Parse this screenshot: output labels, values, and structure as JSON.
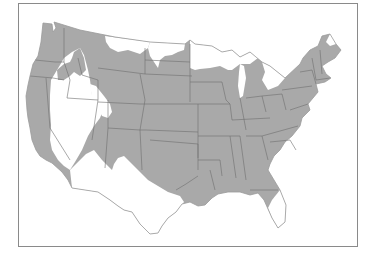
{
  "map": {
    "subject": "United States (contiguous) distribution map",
    "legend": [],
    "colors": {
      "shaded_region": "#a9a9a9",
      "unshaded_region": "#ffffff",
      "state_borders": "#6e6e6e",
      "frame": "#8a8a8a"
    },
    "regions": {
      "shaded": "Most of the contiguous US: Pacific coast (WA, OR, CA), northern Rockies, Great Plains, Midwest, South, and East Coast",
      "unshaded": [
        "Northern Minnesota, Wisconsin and Upper Michigan",
        "Northern Maine",
        "Great Basin (Nevada, western Utah, southern Idaho)",
        "Southern Arizona and New Mexico",
        "West and South Texas",
        "Florida peninsula",
        "Northern Montana strip"
      ]
    }
  }
}
